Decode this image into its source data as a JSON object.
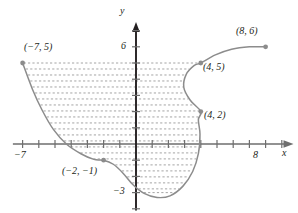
{
  "figure": {
    "title": "",
    "axes": {
      "x_axis_label": "x",
      "y_axis_label": "y",
      "x_tick_labels": [
        {
          "value": -7,
          "text": "−7"
        },
        {
          "value": 8,
          "text": "8"
        }
      ],
      "y_tick_labels": [
        {
          "value": 6,
          "text": "6"
        },
        {
          "value": -3,
          "text": "−3"
        }
      ],
      "x_range": [
        -7.6,
        9.6
      ],
      "y_range": [
        -4.1,
        7.4
      ],
      "tick_spacing": 1,
      "grid": false,
      "arrow_heads": [
        "x-positive",
        "y-positive"
      ]
    },
    "point_labels": [
      {
        "text": "(−7, 5)",
        "x": -7,
        "y": 5
      },
      {
        "text": "(8, 6)",
        "x": 8,
        "y": 6
      },
      {
        "text": "(4, 5)",
        "x": 4,
        "y": 5
      },
      {
        "text": "(4, 2)",
        "x": 4,
        "y": 2
      },
      {
        "text": "(−2, −1)",
        "x": -2,
        "y": -1
      }
    ],
    "marked_points": [
      {
        "name": "point-neg7-5",
        "x": -7,
        "y": 5
      },
      {
        "name": "point-8-6",
        "x": 8,
        "y": 6
      },
      {
        "name": "point-4-5",
        "x": 4,
        "y": 5
      },
      {
        "name": "point-4-2",
        "x": 4,
        "y": 2
      },
      {
        "name": "point-neg2-neg1",
        "x": -2,
        "y": -1
      }
    ],
    "colors": {
      "curve": "#8c8c8c",
      "axis": "#6e6e6e",
      "point": "#8c8c8c",
      "dash": "#9a9a9a",
      "text": "#231f20",
      "background": "#ffffff"
    },
    "region_fill": "horizontal-dashed-lines"
  },
  "chart_data": {
    "type": "line",
    "title": "",
    "xlabel": "x",
    "ylabel": "y",
    "xlim": [
      -7.6,
      9.6
    ],
    "ylim": [
      -4.1,
      7.4
    ],
    "grid": false,
    "annotations": [
      "(−7, 5)",
      "(8, 6)",
      "(4, 5)",
      "(4, 2)",
      "(−2, −1)"
    ],
    "series": [
      {
        "name": "curve",
        "points": [
          [
            -7,
            5
          ],
          [
            -6.4,
            3.4
          ],
          [
            -5.8,
            2.1
          ],
          [
            -5.1,
            0.9
          ],
          [
            -4.3,
            0.0
          ],
          [
            -3.4,
            -0.6
          ],
          [
            -2.6,
            -0.95
          ],
          [
            -2,
            -1
          ],
          [
            -1.4,
            -1.25
          ],
          [
            -0.8,
            -1.8
          ],
          [
            -0.2,
            -2.5
          ],
          [
            0.5,
            -3.05
          ],
          [
            1.3,
            -3.3
          ],
          [
            2.1,
            -3.2
          ],
          [
            2.9,
            -2.6
          ],
          [
            3.5,
            -1.7
          ],
          [
            3.85,
            -0.6
          ],
          [
            3.95,
            0.6
          ],
          [
            3.85,
            1.5
          ],
          [
            4,
            2
          ],
          [
            3.35,
            2.7
          ],
          [
            2.95,
            3.5
          ],
          [
            3.1,
            4.3
          ],
          [
            3.6,
            4.85
          ],
          [
            4,
            5
          ],
          [
            4.9,
            5.5
          ],
          [
            5.9,
            5.85
          ],
          [
            7,
            6.0
          ],
          [
            8,
            6
          ]
        ]
      }
    ],
    "dashed_fill_rows": [
      5.0,
      4.63,
      4.26,
      3.89,
      3.52,
      3.15,
      2.78,
      2.41,
      2.04,
      1.67,
      1.3,
      0.93,
      0.56,
      0.19,
      -0.18,
      -0.55,
      -0.92,
      -1.29,
      -1.66,
      -2.03,
      -2.4,
      -2.77,
      -3.0
    ]
  }
}
